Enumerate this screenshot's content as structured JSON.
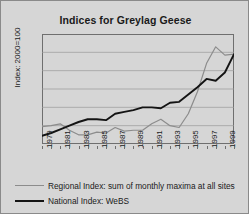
{
  "chart_data": {
    "type": "line",
    "title": "Indices for Greylag Geese",
    "xlabel": "",
    "ylabel": "Index: 2000=100",
    "ylim": [
      0,
      120
    ],
    "yticks": [
      0,
      20,
      40,
      60,
      80,
      100,
      120
    ],
    "grid": true,
    "legend_position": "bottom",
    "x": [
      1979,
      1980,
      1981,
      1982,
      1983,
      1984,
      1985,
      1986,
      1987,
      1988,
      1989,
      1990,
      1991,
      1992,
      1993,
      1994,
      1995,
      1996,
      1997,
      1998,
      1999,
      2000
    ],
    "xtick_labels": [
      "1979",
      "1981",
      "1983",
      "1985",
      "1987",
      "1989",
      "1991",
      "1993",
      "1995",
      "1997",
      "1999"
    ],
    "series": [
      {
        "name": "Regional Index: sum of monthly maxima at all sites",
        "color": "#8c8c8c",
        "values": [
          19,
          20,
          22,
          15,
          10,
          10,
          13,
          12,
          18,
          14,
          15,
          15,
          22,
          27,
          20,
          18,
          33,
          57,
          88,
          106,
          97,
          98
        ]
      },
      {
        "name": "National Index: WeBS",
        "color": "#141414",
        "values": [
          9,
          12,
          16,
          20,
          24,
          27,
          27,
          26,
          33,
          35,
          37,
          40,
          40,
          39,
          45,
          46,
          54,
          62,
          71,
          69,
          78,
          98
        ]
      }
    ]
  },
  "legend": {
    "items": [
      {
        "label": "Regional Index: sum of monthly maxima at all sites"
      },
      {
        "label": "National Index: WeBS"
      }
    ]
  }
}
